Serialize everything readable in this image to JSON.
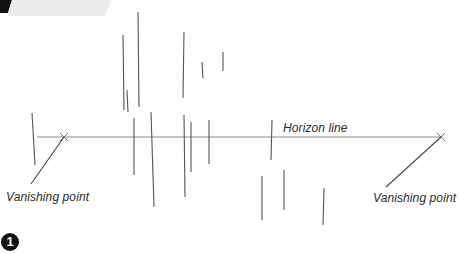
{
  "figure": {
    "step_number": "1",
    "labels": {
      "horizon": "Horizon line",
      "vanishing_left": "Vanishing point",
      "vanishing_right": "Vanishing point"
    },
    "colors": {
      "line": "#555555",
      "horizon": "#8a8a8a",
      "banner_black": "#111111",
      "banner_grey": "#ececec"
    }
  }
}
